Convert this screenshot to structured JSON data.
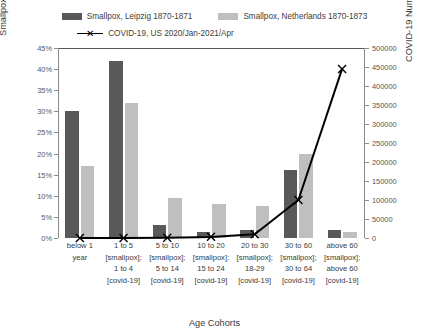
{
  "chart_data": {
    "type": "bar",
    "title": "",
    "xlabel": "Age Cohorts",
    "ylabel": "Smallpox Mortality Rate (%), Leipzig and Netherlands",
    "y2label": "COVID-19 Number of Deaths (N), US",
    "ylim": [
      0,
      45
    ],
    "y2lim": [
      0,
      500000
    ],
    "yticks": [
      "0%",
      "5%",
      "10%",
      "15%",
      "20%",
      "25%",
      "30%",
      "35%",
      "40%",
      "45%"
    ],
    "ytick_values": [
      0,
      5,
      10,
      15,
      20,
      25,
      30,
      35,
      40,
      45
    ],
    "y2ticks": [
      "0",
      "50000",
      "100000",
      "150000",
      "200000",
      "250000",
      "300000",
      "350000",
      "400000",
      "450000",
      "500000"
    ],
    "y2tick_values": [
      0,
      50000,
      100000,
      150000,
      200000,
      250000,
      300000,
      350000,
      400000,
      450000,
      500000
    ],
    "grid": false,
    "legend_position": "top",
    "categories": [
      {
        "line1": "below 1",
        "line2": "year",
        "line3": "",
        "line4": ""
      },
      {
        "line1": "1 to 5",
        "line2": "[smallpox];",
        "line3": "1 to 4",
        "line4": "[covid-19]"
      },
      {
        "line1": "5 to 10",
        "line2": "[smallpox];",
        "line3": "5 to 14",
        "line4": "[covid-19]"
      },
      {
        "line1": "10 to 20",
        "line2": "[smallpox];",
        "line3": "15 to 24",
        "line4": "[covid-19]"
      },
      {
        "line1": "20 to 30",
        "line2": "[smallpox];",
        "line3": "18-29",
        "line4": "[covid-19]"
      },
      {
        "line1": "30 to 60",
        "line2": "[smallpox];",
        "line3": "30 to 64",
        "line4": "[covid-19]"
      },
      {
        "line1": "above 60",
        "line2": "[smallpox];",
        "line3": "above 60",
        "line4": "[covid-19]"
      }
    ],
    "series": [
      {
        "name": "Smallpox, Leipzig 1870-1871",
        "type": "bar",
        "axis": "left",
        "color": "#595959",
        "values": [
          30,
          42,
          3,
          1.5,
          2,
          16,
          2
        ]
      },
      {
        "name": "Smallpox, Netherlands 1870-1873",
        "type": "bar",
        "axis": "left",
        "color": "#bfbfbf",
        "values": [
          17,
          32,
          9.5,
          8,
          7.5,
          20,
          1.5
        ]
      },
      {
        "name": "COVID-19, US 2020/Jan-2021/Apr",
        "type": "line",
        "axis": "right",
        "color": "#000000",
        "marker": "x",
        "values": [
          200,
          300,
          700,
          3000,
          10000,
          100000,
          445000
        ]
      }
    ]
  },
  "legend": {
    "items": [
      {
        "label": "Smallpox, Leipzig 1870-1871",
        "key": "swatch-dark"
      },
      {
        "label": "Smallpox, Netherlands 1870-1873",
        "key": "swatch-light"
      },
      {
        "label": "COVID-19, US 2020/Jan-2021/Apr",
        "key": "line-marker"
      }
    ]
  },
  "axes": {
    "left_title": "Smallpox Mortality Rate (%), Leipzig and Netherlands",
    "right_title": "COVID-19 Number of Deaths (N), US",
    "x_title": "Age Cohorts"
  }
}
